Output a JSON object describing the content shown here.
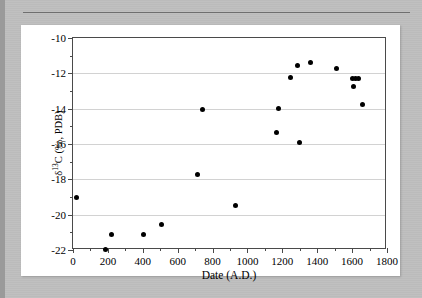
{
  "page": {
    "background_color": "#bdbdbd",
    "card_color": "#ffffff"
  },
  "chart_data": {
    "type": "scatter",
    "title": "",
    "xlabel": "Date (A.D.)",
    "ylabel": "δ13C (‰, PDB)",
    "ylabel_delta": "δ",
    "ylabel_sup": "13",
    "ylabel_rest": "C (‰, PDB)",
    "xlim": [
      0,
      1800
    ],
    "ylim": [
      -22,
      -10
    ],
    "xticks": [
      0,
      200,
      400,
      600,
      800,
      1000,
      1200,
      1400,
      1600,
      1800
    ],
    "xtick_labels": [
      "0",
      "200",
      "400",
      "600",
      "800",
      "1000",
      "1200",
      "1400",
      "1600",
      "1800"
    ],
    "xminor_step": 100,
    "yticks": [
      -10,
      -12,
      -14,
      -16,
      -18,
      -20,
      -22
    ],
    "ytick_labels": [
      "-10",
      "-12",
      "-14",
      "-16",
      "-18",
      "-20",
      "-22"
    ],
    "yminor_step": 1,
    "grid": "horizontal",
    "grid_color": "#d2d2d2",
    "marker": "filled-circle",
    "marker_color": "#000000",
    "legend": "none",
    "points": [
      {
        "x": 20,
        "y": -19.05
      },
      {
        "x": 185,
        "y": -21.95
      },
      {
        "x": 222,
        "y": -21.1
      },
      {
        "x": 402,
        "y": -21.12
      },
      {
        "x": 510,
        "y": -20.55
      },
      {
        "x": 712,
        "y": -17.75
      },
      {
        "x": 742,
        "y": -14.02
      },
      {
        "x": 930,
        "y": -19.5
      },
      {
        "x": 1168,
        "y": -15.35
      },
      {
        "x": 1178,
        "y": -14.0
      },
      {
        "x": 1248,
        "y": -12.22
      },
      {
        "x": 1288,
        "y": -11.58
      },
      {
        "x": 1297,
        "y": -15.92
      },
      {
        "x": 1360,
        "y": -11.36
      },
      {
        "x": 1508,
        "y": -11.7
      },
      {
        "x": 1600,
        "y": -12.32
      },
      {
        "x": 1606,
        "y": -12.72
      },
      {
        "x": 1622,
        "y": -12.3
      },
      {
        "x": 1638,
        "y": -12.3
      },
      {
        "x": 1660,
        "y": -13.78
      }
    ]
  }
}
